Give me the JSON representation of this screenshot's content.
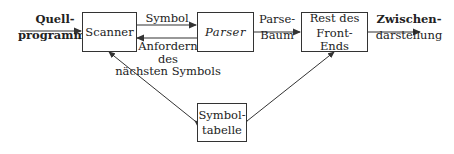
{
  "diagram": {
    "type": "block-diagram",
    "nodes": {
      "scanner": {
        "label": "Scanner"
      },
      "parser": {
        "label": "Parser"
      },
      "rest_front_end": {
        "line1": "Rest des",
        "line2": "Front-Ends"
      },
      "symbol_table": {
        "line1": "Symbol-",
        "line2": "tabelle"
      }
    },
    "edges": {
      "input": {
        "line1": "Quell-",
        "line2": "programm"
      },
      "symbol": {
        "label": "Symbol"
      },
      "request": {
        "line1": "Anfordern",
        "line2": "des",
        "line3": "nächsten Symbols"
      },
      "parse_tree": {
        "line1": "Parse-",
        "line2": "Baum"
      },
      "output": {
        "line1": "Zwischen-",
        "line2": "darstellung"
      }
    },
    "colors": {
      "line": "#333333",
      "background": "#ffffff"
    }
  }
}
